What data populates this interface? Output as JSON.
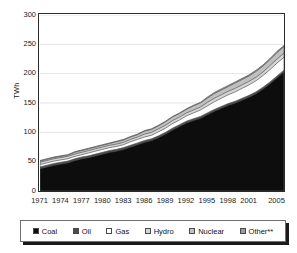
{
  "chart_data": {
    "type": "area",
    "stacked": true,
    "title": "",
    "xlabel": "",
    "ylabel": "TWh",
    "ylim": [
      0,
      300
    ],
    "ytick_labels": [
      "300",
      "250",
      "200",
      "150",
      "100",
      "50",
      "0"
    ],
    "ytick_values": [
      300,
      250,
      200,
      150,
      100,
      50,
      0
    ],
    "grid": true,
    "grid_axis": "y",
    "legend_position": "bottom",
    "x": [
      1971,
      1972,
      1973,
      1974,
      1975,
      1976,
      1977,
      1978,
      1979,
      1980,
      1981,
      1982,
      1983,
      1984,
      1985,
      1986,
      1987,
      1988,
      1989,
      1990,
      1991,
      1992,
      1993,
      1994,
      1995,
      1996,
      1997,
      1998,
      1999,
      2000,
      2001,
      2002,
      2003,
      2004,
      2005,
      2006
    ],
    "xtick_labels": [
      "1971",
      "1974",
      "1977",
      "1980",
      "1983",
      "1986",
      "1989",
      "1992",
      "1995",
      "1998",
      "2001",
      "2005"
    ],
    "xtick_values": [
      1971,
      1974,
      1977,
      1980,
      1983,
      1986,
      1989,
      1992,
      1995,
      1998,
      2001,
      2005
    ],
    "series": [
      {
        "name": "Coal",
        "color": "#0d0d0d",
        "values": [
          38,
          41,
          44,
          46,
          48,
          52,
          55,
          57,
          60,
          63,
          66,
          68,
          71,
          75,
          79,
          83,
          86,
          91,
          97,
          104,
          110,
          116,
          120,
          124,
          130,
          136,
          141,
          146,
          150,
          155,
          160,
          166,
          174,
          183,
          193,
          203
        ]
      },
      {
        "name": "Oil",
        "color": "#4a4a4a",
        "values": [
          3,
          3,
          3,
          3,
          3,
          3,
          3,
          3,
          3,
          3,
          3,
          3,
          3,
          3,
          3,
          3,
          3,
          3,
          3,
          3,
          3,
          3,
          3,
          3,
          3,
          3,
          3,
          3,
          3,
          3,
          3,
          3,
          3,
          3,
          3,
          3
        ]
      },
      {
        "name": "Gas",
        "color": "#ffffff",
        "values": [
          4,
          4,
          4,
          4,
          4,
          4,
          4,
          5,
          5,
          5,
          5,
          5,
          5,
          6,
          6,
          6,
          6,
          7,
          7,
          8,
          8,
          9,
          10,
          11,
          12,
          13,
          14,
          15,
          16,
          17,
          18,
          19,
          20,
          21,
          22,
          22
        ]
      },
      {
        "name": "Hydro",
        "color": "#d5d5d5",
        "values": [
          4,
          4,
          4,
          4,
          4,
          4,
          4,
          4,
          4,
          4,
          4,
          4,
          4,
          4,
          4,
          5,
          5,
          5,
          5,
          5,
          5,
          5,
          5,
          5,
          6,
          6,
          6,
          6,
          6,
          6,
          6,
          6,
          6,
          7,
          7,
          7
        ]
      },
      {
        "name": "Nuclear",
        "color": "#c0c0c0",
        "values": [
          2,
          2,
          2,
          2,
          2,
          3,
          3,
          3,
          3,
          3,
          3,
          4,
          4,
          4,
          4,
          5,
          5,
          5,
          6,
          6,
          6,
          6,
          7,
          7,
          7,
          8,
          8,
          8,
          9,
          9,
          9,
          10,
          10,
          10,
          11,
          11
        ]
      },
      {
        "name": "Other**",
        "color": "#9a9a9a",
        "values": [
          1,
          1,
          1,
          1,
          1,
          1,
          1,
          1,
          1,
          1,
          1,
          1,
          1,
          1,
          1,
          1,
          1,
          1,
          1,
          1,
          1,
          1,
          1,
          1,
          2,
          2,
          2,
          2,
          2,
          2,
          2,
          2,
          2,
          2,
          2,
          2
        ]
      }
    ],
    "totals_note": "Stacked total rises from about 52 TWh in 1971 to about 248 TWh in 2006"
  },
  "legend": {
    "items": [
      {
        "label": "Coal",
        "color": "#0d0d0d",
        "swatch": "coal-swatch"
      },
      {
        "label": "Oil",
        "color": "#4a4a4a",
        "swatch": "oil-swatch"
      },
      {
        "label": "Gas",
        "color": "#ffffff",
        "swatch": "gas-swatch"
      },
      {
        "label": "Hydro",
        "color": "#d5d5d5",
        "swatch": "hydro-swatch"
      },
      {
        "label": "Nuclear",
        "color": "#c0c0c0",
        "swatch": "nuclear-swatch"
      },
      {
        "label": "Other**",
        "color": "#9a9a9a",
        "swatch": "other-swatch"
      }
    ]
  },
  "style": {
    "axis_color": "#2b2b2b",
    "grid_color": "#e3e3e3",
    "text_color": "#1a1a1a",
    "plot_background": "#ffffff"
  }
}
